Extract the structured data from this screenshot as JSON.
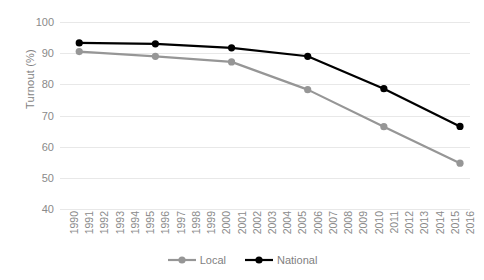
{
  "chart_data": {
    "type": "line",
    "title": "",
    "subtitle": "",
    "xlabel": "",
    "ylabel": "Turnout (%)",
    "ylim": [
      40,
      100
    ],
    "ytick_labels": [
      "100",
      "90",
      "80",
      "70",
      "60",
      "50",
      "40"
    ],
    "ytick_values": [
      100,
      90,
      80,
      70,
      60,
      50,
      40
    ],
    "grid": true,
    "legend_position": "bottom-center",
    "x": [
      1990,
      1991,
      1992,
      1993,
      1994,
      1995,
      1996,
      1997,
      1998,
      1999,
      2000,
      2001,
      2002,
      2003,
      2004,
      2005,
      2006,
      2007,
      2008,
      2009,
      2010,
      2011,
      2012,
      2013,
      2014,
      2015,
      2016
    ],
    "xtick_labels": [
      "1990",
      "1991",
      "1992",
      "1993",
      "1994",
      "1995",
      "1996",
      "1997",
      "1998",
      "1999",
      "2000",
      "2001",
      "2002",
      "2003",
      "2004",
      "2005",
      "2006",
      "2007",
      "2008",
      "2009",
      "2010",
      "2011",
      "2012",
      "2013",
      "2014",
      "2015",
      "2016"
    ],
    "xlim": [
      1990,
      2016
    ],
    "series": [
      {
        "name": "Local",
        "color": "#969696",
        "points": [
          {
            "x": 1991,
            "y": 90.5
          },
          {
            "x": 1996,
            "y": 89.0
          },
          {
            "x": 2001,
            "y": 87.2
          },
          {
            "x": 2006,
            "y": 78.3
          },
          {
            "x": 2011,
            "y": 66.4
          },
          {
            "x": 2016,
            "y": 54.7
          }
        ]
      },
      {
        "name": "National",
        "color": "#000000",
        "points": [
          {
            "x": 1991,
            "y": 93.3
          },
          {
            "x": 1996,
            "y": 93.0
          },
          {
            "x": 2001,
            "y": 91.7
          },
          {
            "x": 2006,
            "y": 89.0
          },
          {
            "x": 2011,
            "y": 78.6
          },
          {
            "x": 2016,
            "y": 66.5
          }
        ]
      }
    ]
  },
  "legend": {
    "entries": [
      {
        "label": "Local",
        "color": "#969696"
      },
      {
        "label": "National",
        "color": "#000000"
      }
    ]
  }
}
